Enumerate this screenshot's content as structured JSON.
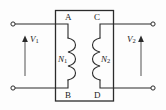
{
  "figure": {
    "type": "circuit-diagram",
    "name": "Transformer with primary and secondary windings",
    "background_color": "#fdfdfd",
    "line_color": "#2b2b2b",
    "label_color": "#1a1a1a"
  },
  "core": {
    "name": "transformer-core",
    "shape": "rectangle"
  },
  "nodes": {
    "top_left": "A",
    "top_right": "C",
    "bottom_left": "B",
    "bottom_right": "D"
  },
  "coils": {
    "primary": {
      "symbol": "N",
      "subscript": "1",
      "full": "N1",
      "side": "left",
      "turns": 3
    },
    "secondary": {
      "symbol": "N",
      "subscript": "2",
      "full": "N2",
      "side": "right",
      "turns": 3
    }
  },
  "voltages": {
    "primary": {
      "symbol": "V",
      "subscript": "1",
      "full": "V1",
      "arrow_direction": "up",
      "label_position": "right-of-arrow"
    },
    "secondary": {
      "symbol": "V",
      "subscript": "2",
      "full": "V2",
      "arrow_direction": "up",
      "label_position": "left-of-arrow"
    }
  },
  "terminals": [
    {
      "name": "terminal-top-left",
      "x": 13,
      "y": 24
    },
    {
      "name": "terminal-bottom-left",
      "x": 13,
      "y": 88
    },
    {
      "name": "terminal-top-right",
      "x": 153,
      "y": 24
    },
    {
      "name": "terminal-bottom-right",
      "x": 153,
      "y": 88
    }
  ]
}
